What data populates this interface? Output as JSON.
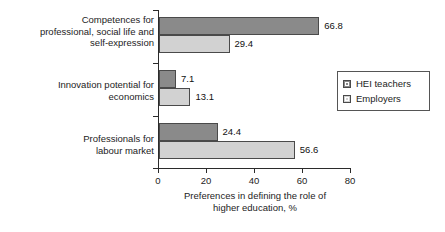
{
  "chart_data": {
    "type": "bar",
    "orientation": "horizontal",
    "title": "",
    "xlabel": "Preferences in defining the role of\nhigher education, %",
    "ylabel": "",
    "xlim": [
      0,
      80
    ],
    "xticks": [
      0,
      20,
      40,
      60,
      80
    ],
    "xtick_labels": [
      "0",
      "20",
      "40",
      "60",
      "80"
    ],
    "grid": false,
    "legend_position": "right",
    "categories": [
      "Competences for\nprofessional, social life and\nself-expression",
      "Innovation potential for\neconomics",
      "Professionals for\nlabour market"
    ],
    "series": [
      {
        "name": "HEI teachers",
        "color": "#8a8a8a",
        "values": [
          66.8,
          7.1,
          24.4
        ],
        "value_labels": [
          "66.8",
          "7.1",
          "24.4"
        ]
      },
      {
        "name": "Employers",
        "color": "#d2d2d2",
        "values": [
          29.4,
          13.1,
          56.6
        ],
        "value_labels": [
          "29.4",
          "13.1",
          "56.6"
        ]
      }
    ]
  },
  "legend": {
    "items": [
      {
        "label": "HEI teachers",
        "swatch": "dark-gray-swatch-icon"
      },
      {
        "label": "Employers",
        "swatch": "light-gray-swatch-icon"
      }
    ]
  }
}
